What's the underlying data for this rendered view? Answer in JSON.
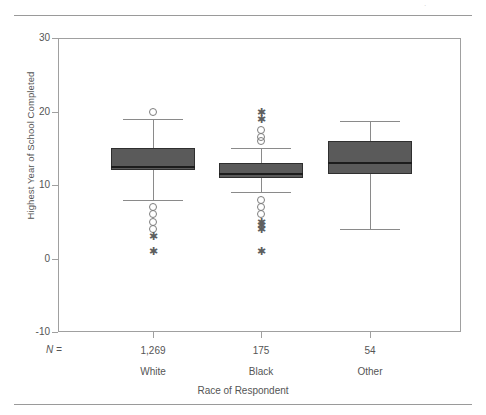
{
  "figure": {
    "top_rule": "horizontal-rule",
    "bottom_rule": "horizontal-rule",
    "artifact_glyph": "·"
  },
  "axes": {
    "y": {
      "label": "Highest Year of School Completed",
      "ticks": [
        30,
        20,
        10,
        0,
        -10
      ],
      "range": [
        -10,
        30
      ]
    },
    "x": {
      "label": "Race of Respondent",
      "n_prefix": "N ="
    }
  },
  "chart_data": {
    "type": "box",
    "title": "",
    "xlabel": "Race of Respondent",
    "ylabel": "Highest Year of School Completed",
    "ylim": [
      -10,
      30
    ],
    "yticks": [
      30,
      20,
      10,
      0,
      -10
    ],
    "grid": false,
    "legend": "none",
    "categories": [
      "White",
      "Black",
      "Other"
    ],
    "counts": [
      "1,269",
      "175",
      "54"
    ],
    "boxes": [
      {
        "name": "White",
        "n": "1,269",
        "whisker_low": 8,
        "q1": 12,
        "median": 12.5,
        "q3": 15,
        "whisker_high": 19,
        "outliers_circle": [
          20,
          7,
          6,
          5,
          4
        ],
        "outliers_star": [
          3,
          1
        ]
      },
      {
        "name": "Black",
        "n": "175",
        "whisker_low": 9,
        "q1": 11,
        "median": 11.5,
        "q3": 13,
        "whisker_high": 15,
        "outliers_circle": [
          17.5,
          16.5,
          16,
          8,
          7,
          6
        ],
        "outliers_star": [
          20,
          19,
          5,
          4.5,
          4,
          1
        ]
      },
      {
        "name": "Other",
        "n": "54",
        "whisker_low": 4,
        "q1": 11.5,
        "median": 13,
        "q3": 16,
        "whisker_high": 18.7,
        "outliers_circle": [],
        "outliers_star": []
      }
    ]
  },
  "colors": {
    "box_fill": "#5a5a5a",
    "box_edge": "#2f2f2f",
    "median": "#1c1c1c",
    "whisker": "#8a8a8a",
    "frame": "#a0a0a0",
    "text": "#555555"
  }
}
